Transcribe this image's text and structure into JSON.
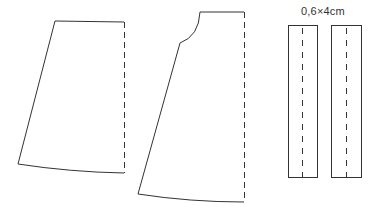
{
  "diagram": {
    "pieces": [
      {
        "name": "skirt-panel-plain",
        "fold_line": "dashed right edge"
      },
      {
        "name": "skirt-panel-curved",
        "fold_line": "dashed right edge"
      },
      {
        "name": "strip-1",
        "fold_line": "dashed center"
      },
      {
        "name": "strip-2",
        "fold_line": "dashed center"
      }
    ],
    "strip_dimension_label": "0,6×4cm",
    "colors": {
      "line": "#333333",
      "background": "#ffffff"
    }
  }
}
